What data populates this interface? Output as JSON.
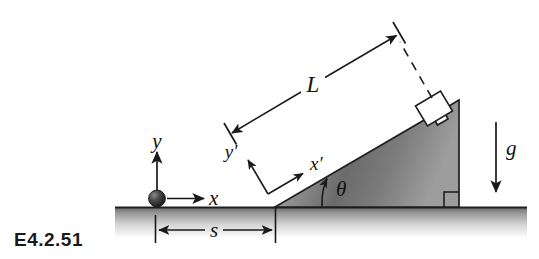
{
  "figure": {
    "id_label": "E4.2.51",
    "type": "physics-free-body-diagram"
  },
  "labels": {
    "length_L": "L",
    "distance_s": "s",
    "angle_theta": "θ",
    "gravity_g": "g",
    "axis_x": "x",
    "axis_y": "y",
    "axis_x_prime": "x′",
    "axis_y_prime": "y′"
  },
  "geometry": {
    "ground_y": 207,
    "ground_x_start": 115,
    "ground_x_end": 527,
    "incline_base_x": 275,
    "incline_apex_x": 459,
    "incline_apex_y": 100,
    "incline_angle_deg": 30,
    "ball_center_x": 157,
    "ball_center_y": 198,
    "ball_radius": 8,
    "s_tick_left_x": 155,
    "s_tick_right_x": 275,
    "s_dim_y": 228
  },
  "colors": {
    "ink": "#1a1a1a",
    "ground_top": "#7d7d7d",
    "ground_bottom": "#ffffff",
    "wedge_light": "#d9d9d9",
    "wedge_mid": "#6e6e6e",
    "wedge_dark": "#8c8c8c",
    "ball_dark": "#2b2b2b",
    "ball_light": "#7a7a7a",
    "block_fill": "#ffffff",
    "background": "#ffffff"
  }
}
